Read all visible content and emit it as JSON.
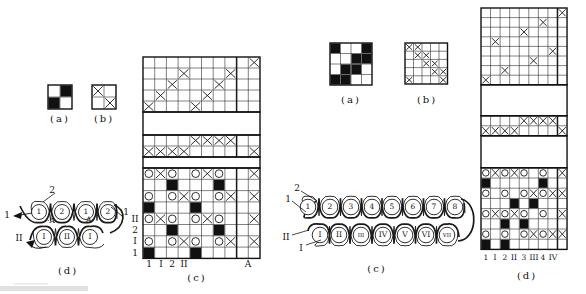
{
  "left": {
    "grid_a": {
      "caption": "(a)",
      "cells": [
        ".b",
        "b."
      ]
    },
    "grid_b": {
      "caption": "(b)",
      "cells": [
        "x.",
        ".x"
      ]
    },
    "grid_c": {
      "caption": "(c)",
      "threading": [
        ".........x",
        "...x...x..",
        "..x...x...",
        ".x...x....",
        "x...x....."
      ],
      "tie": [
        "....xxxx..",
        "xxxx.....x"
      ],
      "knit": [
        "oxo.oxo..x",
        "..b...b...",
        "o.oxo.ox.x",
        "b...b.....",
        "oxo.oxo..x",
        "..b...b...",
        "o.oxo.ox.x",
        "b...b....."
      ],
      "col_labels": [
        "1",
        "I",
        "2",
        "II"
      ],
      "corner_label": "A",
      "row_labels": [
        "II",
        "2",
        "I",
        "1"
      ]
    },
    "chain": {
      "caption": "(d)",
      "top_circles": [
        "1",
        "2",
        "1",
        "2"
      ],
      "bottom_circles": [
        "I",
        "II",
        "I"
      ],
      "label_top": "2",
      "label_left": "1",
      "label_bottom": "II",
      "label_right": "1",
      "mark_left": "·A",
      "mark_right": "A·"
    }
  },
  "right": {
    "grid_a": {
      "caption": "(a)",
      "cells": [
        "b..b",
        "..bb",
        ".bb.",
        "bb.."
      ]
    },
    "grid_b": {
      "caption": "(b)",
      "cells": [
        "xx...",
        ".xx..",
        "..xx.",
        "...xx",
        "x...x"
      ]
    },
    "chain": {
      "caption": "(c)",
      "top_circles": [
        "1",
        "2",
        "3",
        "4",
        "5",
        "6",
        "7",
        "8"
      ],
      "bottom_circles": [
        "I",
        "II",
        "III",
        "IV",
        "V",
        "VI",
        "VII"
      ],
      "label_top": "2",
      "label_left": "1",
      "label_bottom_left": "II",
      "label_bottom": "I"
    },
    "grid_d": {
      "caption": "(d)",
      "threading": [
        "........x",
        "......x..",
        "....x....",
        ".x.......",
        ".......x.",
        ".....x...",
        "..x......",
        "x........"
      ],
      "tie": [
        "....xxxx.",
        "xxxx....x"
      ],
      "knit": [
        "oxoxo.o.x",
        "b.....b..",
        "o.o.oxoxx",
        "...b.b...",
        "oxoxo.o.x",
        "..b.b....",
        "o.o.oxoxx",
        "b.b......"
      ],
      "col_labels": [
        "1",
        "I",
        "2",
        "II",
        "3",
        "III",
        "4",
        "IV"
      ]
    }
  }
}
